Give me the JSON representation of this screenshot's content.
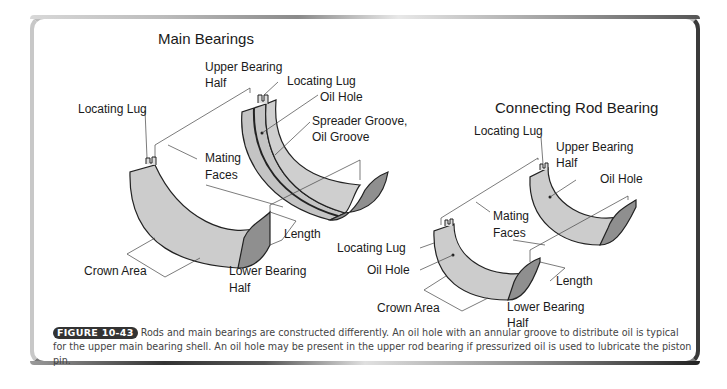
{
  "main_bearings": {
    "title": "Main Bearings",
    "labels": {
      "upper_bearing_half_1": "Upper Bearing",
      "upper_bearing_half_2": "Half",
      "locating_lug_upper": "Locating Lug",
      "oil_hole": "Oil Hole",
      "spreader_groove_1": "Spreader Groove,",
      "spreader_groove_2": "Oil Groove",
      "locating_lug_lower": "Locating Lug",
      "mating_faces_1": "Mating",
      "mating_faces_2": "Faces",
      "length": "Length",
      "crown_area": "Crown Area",
      "lower_bearing_half_1": "Lower Bearing",
      "lower_bearing_half_2": "Half"
    }
  },
  "rod_bearing": {
    "title": "Connecting Rod Bearing",
    "labels": {
      "locating_lug_upper": "Locating Lug",
      "upper_bearing_half_1": "Upper Bearing",
      "upper_bearing_half_2": "Half",
      "oil_hole_upper": "Oil Hole",
      "mating_faces_1": "Mating",
      "mating_faces_2": "Faces",
      "locating_lug_lower": "Locating Lug",
      "oil_hole_lower": "Oil Hole",
      "length": "Length",
      "crown_area": "Crown Area",
      "lower_bearing_half_1": "Lower Bearing",
      "lower_bearing_half_2": "Half"
    }
  },
  "caption": {
    "figure_label": "FIGURE 10-43",
    "text": "Rods and main bearings are constructed differently. An oil hole with an annular groove to distribute oil is typical for the upper main bearing shell. An oil hole may be present in the upper rod bearing if pressurized oil is used to lubricate the piston pin."
  },
  "colors": {
    "bearing_fill": "#c8c8c8",
    "bearing_edge": "#8a8a8a",
    "outline": "#222222"
  }
}
